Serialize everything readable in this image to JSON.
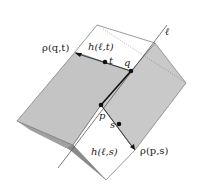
{
  "diagram": {
    "type": "geometric-figure",
    "colors": {
      "background": "#ffffff",
      "face_gray": "#c4c4c4",
      "face_gray_right": "#c9c9c9",
      "fold_dark": "#8a8a8a",
      "edge": "#555555",
      "point": "#111111"
    },
    "labels": {
      "line": "ℓ",
      "rho_qt": "ρ(q,t)",
      "h_lt": "h(ℓ,t)",
      "t": "t",
      "q": "q",
      "p": "p",
      "s": "s",
      "h_ls": "h(ℓ,s)",
      "rho_ps": "ρ(p,s)"
    },
    "points": [
      {
        "name": "q",
        "x": 131,
        "y": 71
      },
      {
        "name": "t",
        "x": 105,
        "y": 62
      },
      {
        "name": "p",
        "x": 101,
        "y": 105
      },
      {
        "name": "s",
        "x": 119,
        "y": 124
      }
    ]
  }
}
